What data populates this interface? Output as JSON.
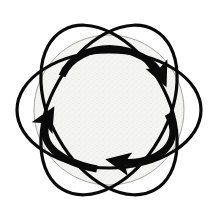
{
  "figure": {
    "title": "Three-fold cyclic rotation diagram",
    "canvas": {
      "width": 218,
      "height": 220,
      "background": "#ffffff"
    },
    "symmetry": {
      "order": 3,
      "angles_deg": [
        0,
        120,
        240
      ],
      "center": {
        "x": 109,
        "y": 110
      }
    }
  },
  "style": {
    "stroke_color": "#0a0a0a",
    "petal_stroke_width": 3.2,
    "arrow_stroke_width": 7.0,
    "disc_fill": "#f2f2f0",
    "disc_stroke": "#9a9a96",
    "disc_stroke_width": 0.9,
    "speckle_color": "#c9c9c4"
  },
  "chart_data": {
    "type": "diagram",
    "title": "Three-fold cyclic rotation diagram",
    "center": {
      "x": 109,
      "y": 110
    },
    "central_disc": {
      "cx": 109,
      "cy": 110,
      "r": 75,
      "fill": "#f2f2f0",
      "label": "shaded-core"
    },
    "petals": [
      {
        "name": "petal-upper-left",
        "cx": 109,
        "cy": 110,
        "rx": 92,
        "ry": 58,
        "rotation_deg": 60
      },
      {
        "name": "petal-upper-right",
        "cx": 109,
        "cy": 110,
        "rx": 92,
        "ry": 58,
        "rotation_deg": 120
      },
      {
        "name": "petal-horizontal",
        "cx": 109,
        "cy": 110,
        "rx": 92,
        "ry": 58,
        "rotation_deg": 0
      }
    ],
    "arrows": [
      {
        "name": "arrow-top",
        "direction": "clockwise",
        "tail": {
          "x": 62,
          "y": 76
        },
        "head": {
          "x": 166,
          "y": 83
        },
        "head_angle_deg": 55,
        "arc_sweep": "outward-top",
        "rotation_deg": 0
      },
      {
        "name": "arrow-bottom-right",
        "direction": "clockwise",
        "tail": {
          "x": 170,
          "y": 116
        },
        "head": {
          "x": 110,
          "y": 161
        },
        "head_angle_deg": 180,
        "arc_sweep": "outward-right",
        "rotation_deg": 120
      },
      {
        "name": "arrow-left",
        "direction": "clockwise",
        "tail": {
          "x": 95,
          "y": 168
        },
        "head": {
          "x": 47,
          "y": 110
        },
        "head_angle_deg": 300,
        "arc_sweep": "outward-left",
        "rotation_deg": 240
      }
    ],
    "legend": [],
    "annotations": []
  }
}
